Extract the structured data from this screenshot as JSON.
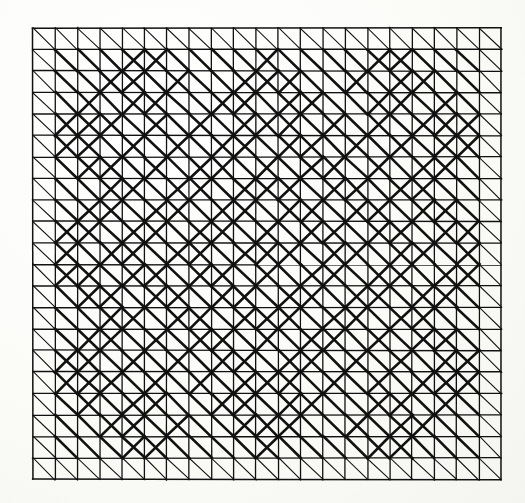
{
  "figure": {
    "medium": "black ink on off-white paper",
    "background_color": "#fbfbf8",
    "ink_color": "#111111"
  },
  "grid": {
    "columns": 21,
    "rows": 21,
    "origin_x": 33,
    "origin_y": 28,
    "cell_width": 22.3,
    "cell_height": 21.5,
    "border_stroke_width": 1.5,
    "line_stroke_width": 1.3,
    "thin_diagonal_stroke_width": 1.1,
    "thick_diagonal_stroke_width": 2.6,
    "outer_ring_thickness": 1,
    "backslash_in_every_cell": true
  },
  "pattern": {
    "legend": [
      {
        "name": "backslash-diagonal",
        "direction": "NW-SE",
        "present_in": "all cells"
      },
      {
        "name": "slash-diagonal",
        "direction": "SW-NE",
        "present_in": "listed cells only"
      }
    ],
    "slash_cells_note": "Each entry is [row, column], zero-indexed from the top-left cell of the 21x21 grid.",
    "slash_cells": [
      [
        1,
        4
      ],
      [
        1,
        5
      ],
      [
        1,
        10
      ],
      [
        1,
        15
      ],
      [
        1,
        16
      ],
      [
        2,
        3
      ],
      [
        2,
        4
      ],
      [
        2,
        6
      ],
      [
        2,
        9
      ],
      [
        2,
        10
      ],
      [
        2,
        11
      ],
      [
        2,
        14
      ],
      [
        2,
        16
      ],
      [
        2,
        17
      ],
      [
        3,
        2
      ],
      [
        3,
        4
      ],
      [
        3,
        5
      ],
      [
        3,
        8
      ],
      [
        3,
        9
      ],
      [
        3,
        11
      ],
      [
        3,
        12
      ],
      [
        3,
        15
      ],
      [
        3,
        16
      ],
      [
        3,
        18
      ],
      [
        4,
        1
      ],
      [
        4,
        2
      ],
      [
        4,
        3
      ],
      [
        4,
        5
      ],
      [
        4,
        7
      ],
      [
        4,
        9
      ],
      [
        4,
        10
      ],
      [
        4,
        11
      ],
      [
        4,
        13
      ],
      [
        4,
        15
      ],
      [
        4,
        17
      ],
      [
        4,
        18
      ],
      [
        4,
        19
      ],
      [
        5,
        1
      ],
      [
        5,
        2
      ],
      [
        5,
        4
      ],
      [
        5,
        6
      ],
      [
        5,
        8
      ],
      [
        5,
        9
      ],
      [
        5,
        11
      ],
      [
        5,
        12
      ],
      [
        5,
        14
      ],
      [
        5,
        16
      ],
      [
        5,
        18
      ],
      [
        5,
        19
      ],
      [
        6,
        2
      ],
      [
        6,
        3
      ],
      [
        6,
        5
      ],
      [
        6,
        7
      ],
      [
        6,
        8
      ],
      [
        6,
        10
      ],
      [
        6,
        12
      ],
      [
        6,
        13
      ],
      [
        6,
        15
      ],
      [
        6,
        17
      ],
      [
        6,
        18
      ],
      [
        7,
        3
      ],
      [
        7,
        4
      ],
      [
        7,
        6
      ],
      [
        7,
        7
      ],
      [
        7,
        9
      ],
      [
        7,
        10
      ],
      [
        7,
        11
      ],
      [
        7,
        13
      ],
      [
        7,
        14
      ],
      [
        7,
        16
      ],
      [
        7,
        17
      ],
      [
        8,
        2
      ],
      [
        8,
        3
      ],
      [
        8,
        5
      ],
      [
        8,
        6
      ],
      [
        8,
        8
      ],
      [
        8,
        9
      ],
      [
        8,
        11
      ],
      [
        8,
        12
      ],
      [
        8,
        14
      ],
      [
        8,
        15
      ],
      [
        8,
        17
      ],
      [
        8,
        18
      ],
      [
        9,
        1
      ],
      [
        9,
        2
      ],
      [
        9,
        4
      ],
      [
        9,
        5
      ],
      [
        9,
        7
      ],
      [
        9,
        8
      ],
      [
        9,
        10
      ],
      [
        9,
        12
      ],
      [
        9,
        13
      ],
      [
        9,
        15
      ],
      [
        9,
        16
      ],
      [
        9,
        18
      ],
      [
        9,
        19
      ],
      [
        10,
        1
      ],
      [
        10,
        3
      ],
      [
        10,
        4
      ],
      [
        10,
        6
      ],
      [
        10,
        7
      ],
      [
        10,
        9
      ],
      [
        10,
        10
      ],
      [
        10,
        11
      ],
      [
        10,
        13
      ],
      [
        10,
        14
      ],
      [
        10,
        16
      ],
      [
        10,
        17
      ],
      [
        10,
        19
      ],
      [
        11,
        1
      ],
      [
        11,
        2
      ],
      [
        11,
        4
      ],
      [
        11,
        5
      ],
      [
        11,
        7
      ],
      [
        11,
        8
      ],
      [
        11,
        10
      ],
      [
        11,
        12
      ],
      [
        11,
        13
      ],
      [
        11,
        15
      ],
      [
        11,
        16
      ],
      [
        11,
        18
      ],
      [
        11,
        19
      ],
      [
        12,
        2
      ],
      [
        12,
        3
      ],
      [
        12,
        5
      ],
      [
        12,
        6
      ],
      [
        12,
        8
      ],
      [
        12,
        9
      ],
      [
        12,
        11
      ],
      [
        12,
        12
      ],
      [
        12,
        14
      ],
      [
        12,
        15
      ],
      [
        12,
        17
      ],
      [
        12,
        18
      ],
      [
        13,
        3
      ],
      [
        13,
        4
      ],
      [
        13,
        6
      ],
      [
        13,
        7
      ],
      [
        13,
        9
      ],
      [
        13,
        10
      ],
      [
        13,
        11
      ],
      [
        13,
        13
      ],
      [
        13,
        14
      ],
      [
        13,
        16
      ],
      [
        13,
        17
      ],
      [
        14,
        2
      ],
      [
        14,
        3
      ],
      [
        14,
        5
      ],
      [
        14,
        7
      ],
      [
        14,
        8
      ],
      [
        14,
        10
      ],
      [
        14,
        12
      ],
      [
        14,
        13
      ],
      [
        14,
        15
      ],
      [
        14,
        17
      ],
      [
        14,
        18
      ],
      [
        15,
        1
      ],
      [
        15,
        2
      ],
      [
        15,
        4
      ],
      [
        15,
        6
      ],
      [
        15,
        8
      ],
      [
        15,
        9
      ],
      [
        15,
        11
      ],
      [
        15,
        12
      ],
      [
        15,
        14
      ],
      [
        15,
        16
      ],
      [
        15,
        18
      ],
      [
        15,
        19
      ],
      [
        16,
        1
      ],
      [
        16,
        2
      ],
      [
        16,
        3
      ],
      [
        16,
        5
      ],
      [
        16,
        7
      ],
      [
        16,
        9
      ],
      [
        16,
        10
      ],
      [
        16,
        11
      ],
      [
        16,
        13
      ],
      [
        16,
        15
      ],
      [
        16,
        17
      ],
      [
        16,
        18
      ],
      [
        16,
        19
      ],
      [
        17,
        2
      ],
      [
        17,
        4
      ],
      [
        17,
        5
      ],
      [
        17,
        8
      ],
      [
        17,
        9
      ],
      [
        17,
        11
      ],
      [
        17,
        12
      ],
      [
        17,
        15
      ],
      [
        17,
        16
      ],
      [
        17,
        18
      ],
      [
        18,
        3
      ],
      [
        18,
        4
      ],
      [
        18,
        6
      ],
      [
        18,
        9
      ],
      [
        18,
        10
      ],
      [
        18,
        11
      ],
      [
        18,
        14
      ],
      [
        18,
        16
      ],
      [
        18,
        17
      ],
      [
        19,
        4
      ],
      [
        19,
        5
      ],
      [
        19,
        10
      ],
      [
        19,
        15
      ],
      [
        19,
        16
      ]
    ],
    "thick_region": {
      "note": "Cells outside this inset row/column band are drawn with the thin hairline weight.",
      "row_min": 1,
      "row_max": 19,
      "col_min": 1,
      "col_max": 19
    }
  }
}
